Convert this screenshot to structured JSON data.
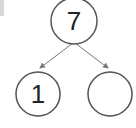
{
  "diagram": {
    "type": "number-bond",
    "top": {
      "value": "7"
    },
    "left": {
      "value": "1"
    },
    "right": {
      "value": ""
    },
    "colors": {
      "stroke": "#555555",
      "arrow": "#777777",
      "text": "#222222"
    }
  }
}
